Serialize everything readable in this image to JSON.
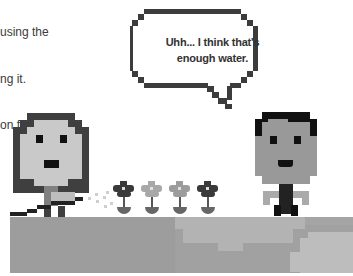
{
  "intro_text": {
    "lines": [
      "using the",
      "ng it.",
      "on from"
    ]
  },
  "speech_bubble": {
    "line1": "Uhh... I think that's",
    "line2": "enough water."
  },
  "scene": {
    "characters": [
      "girl-with-hose",
      "boy"
    ],
    "flowers": 4,
    "colors": {
      "outline": "#3c3c3c",
      "skin_girl": "#c9c9c9",
      "skin_boy": "#999999",
      "hair_girl": "#3f3f3f",
      "hair_boy": "#111111",
      "ground_dark": "#9a9a9a",
      "ground_mid": "#a9a9a9",
      "ground_light": "#bdbdbd",
      "flower_dark": "#3a3a3a",
      "flower_light": "#a8a8a8"
    }
  }
}
